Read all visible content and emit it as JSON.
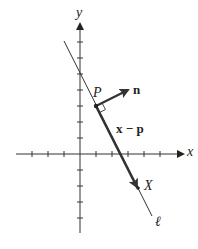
{
  "diagram": {
    "title": "",
    "colors": {
      "axis": "#333333",
      "line": "#333333",
      "vector": "#333333",
      "background": "#ffffff"
    },
    "axes": {
      "x_label": "x",
      "y_label": "y",
      "origin_px": [
        80,
        154
      ],
      "tick_spacing_px": 16,
      "x_ticks": [
        -4,
        -3,
        -2,
        -1,
        1,
        2,
        3,
        4,
        5
      ],
      "y_ticks": [
        -5,
        -4,
        -3,
        -2,
        -1,
        1,
        2,
        3,
        4,
        5,
        6,
        7
      ]
    },
    "points": {
      "P": {
        "label": "P",
        "coords": [
          1,
          3
        ]
      },
      "X": {
        "label": "X",
        "coords": [
          3.6,
          -2.1
        ]
      }
    },
    "vectors": {
      "n": {
        "label": "n",
        "from": [
          1,
          3
        ],
        "to": [
          3.05,
          4.05
        ]
      },
      "x_minus_p": {
        "label": "x − p",
        "from": [
          1,
          3
        ],
        "to": [
          3.6,
          -2.1
        ]
      }
    },
    "line_l": {
      "label": "ℓ",
      "from_px": [
        64,
        41
      ],
      "to_px": [
        152,
        216
      ]
    },
    "right_angle_marker": true
  }
}
